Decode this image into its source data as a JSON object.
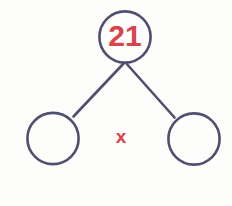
{
  "diagram": {
    "type": "number-bond",
    "background_color": "#fdfdfc",
    "stroke_color": "#4f4f6e",
    "text_color": "#d8434c",
    "whole": {
      "label": "21",
      "filled": true
    },
    "parts": [
      {
        "label": "",
        "filled": false
      },
      {
        "label": "",
        "filled": false
      }
    ],
    "operator": {
      "symbol": "x",
      "name": "multiplication-symbol"
    }
  }
}
